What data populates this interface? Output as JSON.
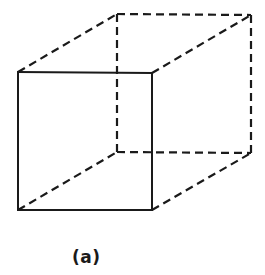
{
  "figure": {
    "caption": "(a)",
    "type": "wireframe-cube",
    "stroke_color": "#1a1a1a",
    "background": "#ffffff",
    "vertices": {
      "front_top_left": [
        18,
        72
      ],
      "front_top_right": [
        152,
        73
      ],
      "front_bottom_left": [
        18,
        210
      ],
      "front_bottom_right": [
        152,
        210
      ],
      "back_top_left": [
        117,
        14
      ],
      "back_top_right": [
        251,
        15
      ],
      "back_bottom_left": [
        117,
        152
      ],
      "back_bottom_right": [
        251,
        153
      ]
    },
    "edges": {
      "solid": [
        [
          "front_top_left",
          "front_top_right"
        ],
        [
          "front_top_right",
          "front_bottom_right"
        ],
        [
          "front_bottom_right",
          "front_bottom_left"
        ],
        [
          "front_bottom_left",
          "front_top_left"
        ]
      ],
      "dashed": [
        [
          "front_top_left",
          "back_top_left"
        ],
        [
          "front_top_right",
          "back_top_right"
        ],
        [
          "back_top_left",
          "back_top_right"
        ],
        [
          "back_top_left",
          "back_bottom_left"
        ],
        [
          "back_top_right",
          "back_bottom_right"
        ],
        [
          "back_bottom_left",
          "back_bottom_right"
        ],
        [
          "front_bottom_left",
          "back_bottom_left"
        ],
        [
          "front_bottom_right",
          "back_bottom_right"
        ]
      ]
    }
  }
}
